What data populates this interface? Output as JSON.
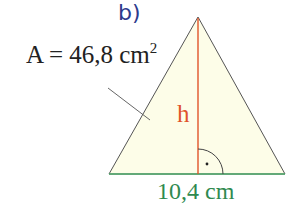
{
  "figure": {
    "part": "b)",
    "area_label": "A = 46,8 cm",
    "area_exponent": "2",
    "height_label": "h",
    "base_label": "10,4 cm",
    "colors": {
      "part": "#2d3a8c",
      "fill": "#fdfde8",
      "height": "#e0532a",
      "base": "#2f8a50",
      "edges": "#555555"
    }
  }
}
